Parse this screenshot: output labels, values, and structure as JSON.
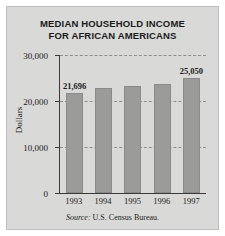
{
  "chart_data": {
    "type": "bar",
    "title": "MEDIAN HOUSEHOLD INCOME FOR AFRICAN AMERICANS",
    "title_line1": "MEDIAN HOUSEHOLD INCOME",
    "title_line2": "FOR AFRICAN AMERICANS",
    "xlabel": "",
    "ylabel": "Dollars",
    "categories": [
      "1993",
      "1994",
      "1995",
      "1996",
      "1997"
    ],
    "values": [
      21696,
      22800,
      23200,
      23800,
      25050
    ],
    "point_labels": [
      "21,696",
      "",
      "",
      "",
      "25,050"
    ],
    "ylim": [
      0,
      30000
    ],
    "yticks": [
      0,
      10000,
      20000,
      30000
    ],
    "ytick_labels": [
      "0",
      "10,000",
      "20,000",
      "30,000"
    ],
    "grid": true,
    "legend": false,
    "bar_color": "#9b9b99",
    "plot_background": "#d9d9d7",
    "axis_color": "#3a3a38"
  },
  "source": {
    "prefix": "Source:",
    "text": "U.S. Census Bureau."
  }
}
